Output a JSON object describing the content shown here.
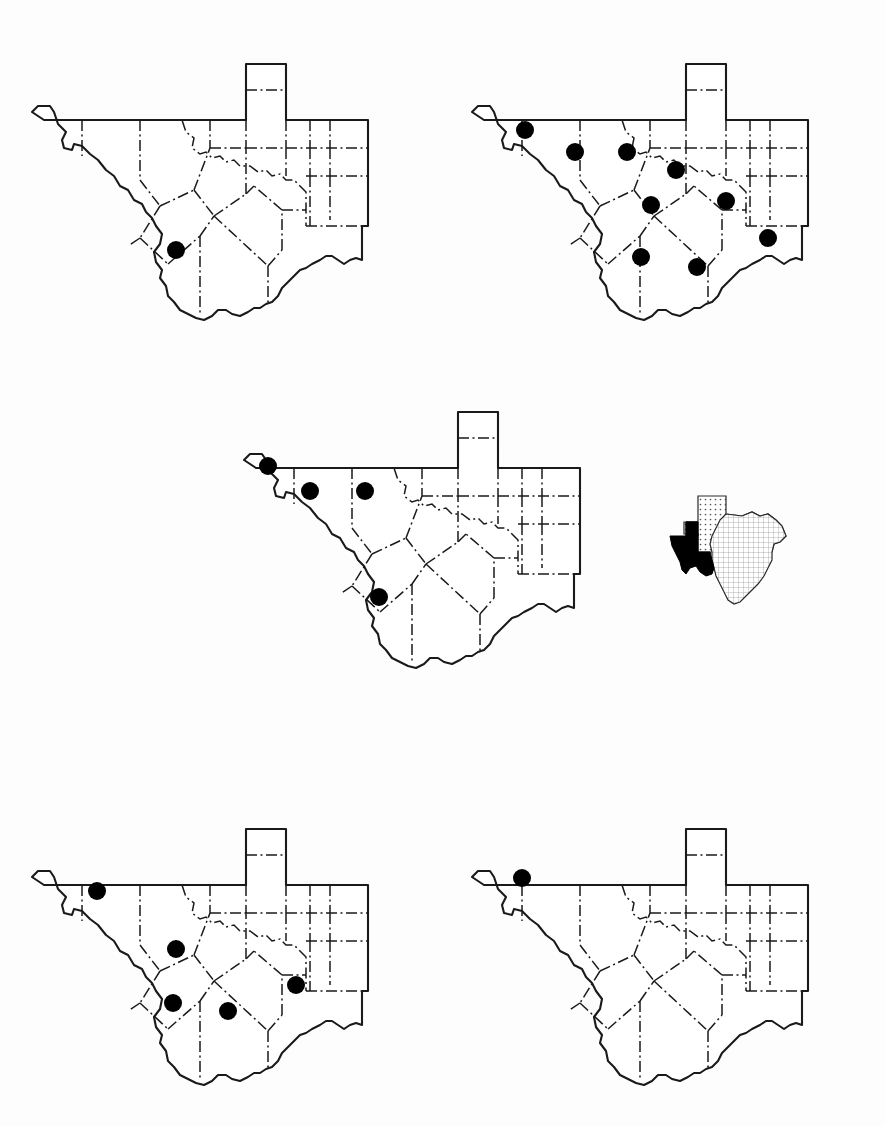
{
  "figure": {
    "background_color": "#fdfdfd",
    "ink_color": "#1a1a1a",
    "dot_color": "#000000",
    "sheet_width": 885,
    "sheet_height": 1126
  },
  "panels": [
    {
      "id": "panel-top-left",
      "position": "top-left",
      "x": 10,
      "y": 20,
      "width": 400,
      "height": 330,
      "scale": 1.0,
      "record_count": 1,
      "dots": [
        {
          "cx": 176,
          "cy": 250,
          "r": 9
        }
      ]
    },
    {
      "id": "panel-top-right",
      "position": "top-right",
      "x": 450,
      "y": 20,
      "width": 400,
      "height": 330,
      "scale": 1.0,
      "record_count": 9,
      "dots": [
        {
          "cx": 525,
          "cy": 130,
          "r": 9
        },
        {
          "cx": 575,
          "cy": 152,
          "r": 9
        },
        {
          "cx": 627,
          "cy": 152,
          "r": 9
        },
        {
          "cx": 676,
          "cy": 170,
          "r": 9
        },
        {
          "cx": 651,
          "cy": 205,
          "r": 9
        },
        {
          "cx": 726,
          "cy": 201,
          "r": 9
        },
        {
          "cx": 641,
          "cy": 257,
          "r": 9
        },
        {
          "cx": 697,
          "cy": 267,
          "r": 9
        },
        {
          "cx": 768,
          "cy": 238,
          "r": 9
        }
      ]
    },
    {
      "id": "panel-middle",
      "position": "middle-center",
      "x": 222,
      "y": 368,
      "width": 400,
      "height": 330,
      "scale": 1.0,
      "record_count": 4,
      "dots": [
        {
          "cx": 268,
          "cy": 466,
          "r": 9
        },
        {
          "cx": 310,
          "cy": 491,
          "r": 9
        },
        {
          "cx": 365,
          "cy": 491,
          "r": 9
        },
        {
          "cx": 379,
          "cy": 597,
          "r": 9
        }
      ]
    },
    {
      "id": "panel-bottom-left",
      "position": "bottom-left",
      "x": 10,
      "y": 785,
      "width": 400,
      "height": 330,
      "scale": 1.0,
      "record_count": 5,
      "dots": [
        {
          "cx": 97,
          "cy": 891,
          "r": 9
        },
        {
          "cx": 176,
          "cy": 949,
          "r": 9
        },
        {
          "cx": 173,
          "cy": 1003,
          "r": 9
        },
        {
          "cx": 228,
          "cy": 1011,
          "r": 9
        },
        {
          "cx": 296,
          "cy": 985,
          "r": 9
        }
      ]
    },
    {
      "id": "panel-bottom-right",
      "position": "bottom-right",
      "x": 450,
      "y": 785,
      "width": 400,
      "height": 330,
      "scale": 1.0,
      "record_count": 1,
      "dots": [
        {
          "cx": 522,
          "cy": 878,
          "r": 9
        }
      ]
    }
  ],
  "inset": {
    "id": "inset-texas-locator",
    "x": 668,
    "y": 492,
    "width": 140,
    "height": 120,
    "shaded_region_label": "Trans-Pecos",
    "shaded_color": "#000000",
    "stipple_color": "#555555"
  },
  "legend": {
    "dot_meaning": "occurrence record",
    "dot_shape": "filled-circle"
  }
}
